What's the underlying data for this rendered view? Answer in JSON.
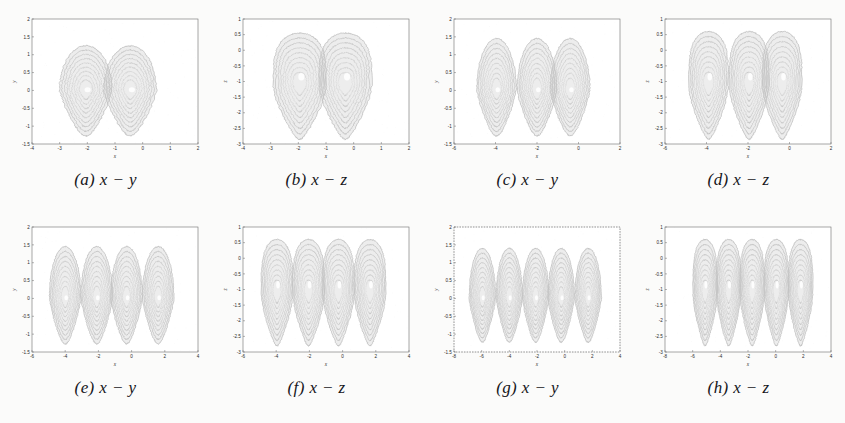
{
  "figure": {
    "background": "#fbfbfa",
    "ink_color": "#3a3a3a",
    "frame_color": "#6d6d6d",
    "rows": 2,
    "columns": 4
  },
  "captions": {
    "a": "(a) x − y",
    "b": "(b) x − z",
    "c": "(c) x − y",
    "d": "(d) x − z",
    "e": "(e) x − y",
    "f": "(f) x − z",
    "g": "(g) x − y",
    "h": "(h) x − z"
  },
  "chart_data": [
    {
      "id": "a",
      "type": "scatter",
      "title": "(a) x − y",
      "xlabel": "x",
      "ylabel": "y",
      "xlim": [
        -4,
        2
      ],
      "ylim": [
        -1.5,
        2
      ],
      "xticks": [
        -4,
        -3,
        -2,
        -1,
        0,
        1,
        2
      ],
      "xticklabels": [
        "-4",
        "-3",
        "-2",
        "-1",
        "0",
        "1",
        "2"
      ],
      "yticks": [
        -1.5,
        -1,
        -0.5,
        0,
        0.5,
        1,
        1.5,
        2
      ],
      "yticklabels": [
        "-1.5",
        "-1",
        "-0.5",
        "0",
        "0.5",
        "1",
        "1.5",
        "2"
      ],
      "grid": false,
      "scrolls": 2,
      "scroll_centers_x": [
        -2.05,
        -0.45
      ],
      "scroll_center_y": 0.0,
      "lobe_top": 1.25,
      "lobe_bottom": -1.3,
      "lobe_halfwidth": 0.95,
      "bands": 9,
      "orientation": "teardrop-up",
      "frame_style": "solid"
    },
    {
      "id": "b",
      "type": "scatter",
      "title": "(b) x − z",
      "xlabel": "x",
      "ylabel": "z",
      "xlim": [
        -4,
        2
      ],
      "ylim": [
        -3,
        1
      ],
      "xticks": [
        -4,
        -3,
        -2,
        -1,
        0,
        1,
        2
      ],
      "xticklabels": [
        "-4",
        "-3",
        "-2",
        "-1",
        "0",
        "1",
        "2"
      ],
      "yticks": [
        -3,
        -2.5,
        -2,
        -1.5,
        -1,
        -0.5,
        0,
        0.5,
        1
      ],
      "yticklabels": [
        "-3",
        "-2.5",
        "-2",
        "-1.5",
        "-1",
        "-0.5",
        "0",
        "0.5",
        "1"
      ],
      "grid": false,
      "scrolls": 2,
      "scroll_centers_x": [
        -1.95,
        -0.3
      ],
      "scroll_center_y": -1.1,
      "lobe_top": 0.55,
      "lobe_bottom": -2.85,
      "lobe_halfwidth": 0.95,
      "bands": 9,
      "orientation": "column-down",
      "frame_style": "solid"
    },
    {
      "id": "c",
      "type": "scatter",
      "title": "(c) x − y",
      "xlabel": "x",
      "ylabel": "y",
      "xlim": [
        -6,
        2
      ],
      "ylim": [
        -1.5,
        2
      ],
      "xticks": [
        -6,
        -4,
        -2,
        0,
        2
      ],
      "xticklabels": [
        "-6",
        "-4",
        "-2",
        "0",
        "2"
      ],
      "yticks": [
        -1.5,
        -1,
        -0.5,
        0,
        0.5,
        1,
        1.5,
        2
      ],
      "yticklabels": [
        "-1.5",
        "-1",
        "-0.5",
        "0",
        "0.5",
        "1",
        "1.5",
        "2"
      ],
      "grid": false,
      "scrolls": 3,
      "scroll_centers_x": [
        -3.95,
        -2.0,
        -0.4
      ],
      "scroll_center_y": 0.0,
      "lobe_top": 1.45,
      "lobe_bottom": -1.3,
      "lobe_halfwidth": 0.95,
      "bands": 9,
      "orientation": "teardrop-up",
      "frame_style": "solid"
    },
    {
      "id": "d",
      "type": "scatter",
      "title": "(d) x − z",
      "xlabel": "x",
      "ylabel": "z",
      "xlim": [
        -6,
        2
      ],
      "ylim": [
        -3,
        1
      ],
      "xticks": [
        -6,
        -4,
        -2,
        0,
        2
      ],
      "xticklabels": [
        "-6",
        "-4",
        "-2",
        "0",
        "2"
      ],
      "yticks": [
        -3,
        -2.5,
        -2,
        -1.5,
        -1,
        -0.5,
        0,
        0.5,
        1
      ],
      "yticklabels": [
        "-3",
        "-2.5",
        "-2",
        "-1.5",
        "-1",
        "-0.5",
        "0",
        "0.5",
        "1"
      ],
      "grid": false,
      "scrolls": 3,
      "scroll_centers_x": [
        -3.9,
        -1.95,
        -0.35
      ],
      "scroll_center_y": -1.1,
      "lobe_top": 0.6,
      "lobe_bottom": -2.85,
      "lobe_halfwidth": 0.95,
      "bands": 9,
      "orientation": "column-down",
      "frame_style": "solid"
    },
    {
      "id": "e",
      "type": "scatter",
      "title": "(e) x − y",
      "xlabel": "x",
      "ylabel": "y",
      "xlim": [
        -6,
        4
      ],
      "ylim": [
        -1.5,
        2
      ],
      "xticks": [
        -6,
        -4,
        -2,
        0,
        2,
        4
      ],
      "xticklabels": [
        "-6",
        "-4",
        "-2",
        "0",
        "2",
        "4"
      ],
      "yticks": [
        -1.5,
        -1,
        -0.5,
        0,
        0.5,
        1,
        1.5,
        2
      ],
      "yticklabels": [
        "-1.5",
        "-1",
        "-0.5",
        "0",
        "0.5",
        "1",
        "1.5",
        "2"
      ],
      "grid": false,
      "scrolls": 4,
      "scroll_centers_x": [
        -4.0,
        -2.1,
        -0.3,
        1.6
      ],
      "scroll_center_y": 0.0,
      "lobe_top": 1.45,
      "lobe_bottom": -1.3,
      "lobe_halfwidth": 0.95,
      "bands": 9,
      "orientation": "teardrop-up",
      "frame_style": "solid"
    },
    {
      "id": "f",
      "type": "scatter",
      "title": "(f) x − z",
      "xlabel": "x",
      "ylabel": "z",
      "xlim": [
        -6,
        4
      ],
      "ylim": [
        -3,
        1
      ],
      "xticks": [
        -6,
        -4,
        -2,
        0,
        2,
        4
      ],
      "xticklabels": [
        "-6",
        "-4",
        "-2",
        "0",
        "2",
        "4"
      ],
      "yticks": [
        -3,
        -2.5,
        -2,
        -1.5,
        -1,
        -0.5,
        0,
        0.5,
        1
      ],
      "yticklabels": [
        "-3",
        "-2.5",
        "-2",
        "-1.5",
        "-1",
        "-0.5",
        "0",
        "0.5",
        "1"
      ],
      "grid": false,
      "scrolls": 4,
      "scroll_centers_x": [
        -3.95,
        -2.05,
        -0.25,
        1.65
      ],
      "scroll_center_y": -1.1,
      "lobe_top": 0.6,
      "lobe_bottom": -2.8,
      "lobe_halfwidth": 0.95,
      "bands": 9,
      "orientation": "column-down",
      "frame_style": "solid"
    },
    {
      "id": "g",
      "type": "scatter",
      "title": "(g) x − y",
      "xlabel": "x",
      "ylabel": "y",
      "xlim": [
        -8,
        4
      ],
      "ylim": [
        -1.5,
        2
      ],
      "xticks": [
        -8,
        -6,
        -4,
        -2,
        0,
        2,
        4
      ],
      "xticklabels": [
        "-8",
        "-6",
        "-4",
        "-2",
        "0",
        "2",
        "4"
      ],
      "yticks": [
        -1.5,
        -1,
        -0.5,
        0,
        0.5,
        1,
        1.5,
        2
      ],
      "yticklabels": [
        "-1.5",
        "-1",
        "-0.5",
        "0",
        "0.5",
        "1",
        "1.5",
        "2"
      ],
      "grid": false,
      "scrolls": 5,
      "scroll_centers_x": [
        -5.95,
        -4.0,
        -2.1,
        -0.25,
        1.7
      ],
      "scroll_center_y": 0.0,
      "lobe_top": 1.4,
      "lobe_bottom": -1.25,
      "lobe_halfwidth": 0.95,
      "bands": 9,
      "orientation": "teardrop-up",
      "frame_style": "dotted"
    },
    {
      "id": "h",
      "type": "scatter",
      "title": "(h) x − z",
      "xlabel": "x",
      "ylabel": "z",
      "xlim": [
        -8,
        4
      ],
      "ylim": [
        -3,
        1
      ],
      "xticks": [
        -8,
        -6,
        -4,
        -2,
        0,
        2,
        4
      ],
      "xticklabels": [
        "-8",
        "-6",
        "-4",
        "-2",
        "0",
        "2",
        "4"
      ],
      "yticks": [
        -3,
        -2.5,
        -2,
        -1.5,
        -1,
        -0.5,
        0,
        0.5,
        1
      ],
      "yticklabels": [
        "-3",
        "-2.5",
        "-2",
        "-1.5",
        "-1",
        "-0.5",
        "0",
        "0.5",
        "1"
      ],
      "grid": false,
      "scrolls": 5,
      "scroll_centers_x": [
        -5.1,
        -3.4,
        -1.7,
        0.05,
        1.8
      ],
      "scroll_center_y": -1.1,
      "lobe_top": 0.6,
      "lobe_bottom": -2.8,
      "lobe_halfwidth": 0.88,
      "bands": 9,
      "orientation": "column-down",
      "frame_style": "solid"
    }
  ]
}
